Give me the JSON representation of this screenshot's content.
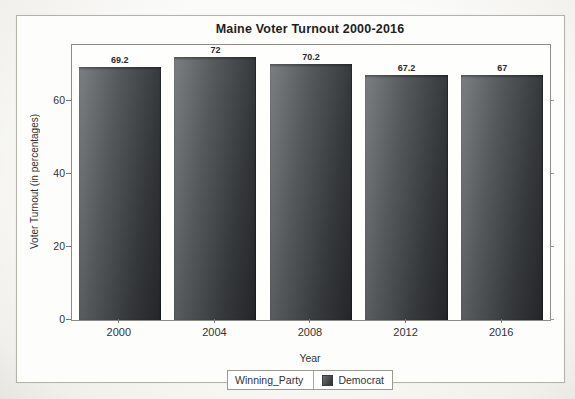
{
  "chart_data": {
    "type": "bar",
    "title": "Maine Voter Turnout 2000-2016",
    "categories": [
      "2000",
      "2004",
      "2008",
      "2012",
      "2016"
    ],
    "values": [
      69.2,
      72,
      70.2,
      67.2,
      67
    ],
    "bar_labels": [
      "69.2",
      "72",
      "70.2",
      "67.2",
      "67"
    ],
    "xlabel": "Year",
    "ylabel": "Voter Turnout (in percentages)",
    "ylim": [
      0,
      75.3
    ],
    "yticks": [
      0,
      20,
      40,
      60
    ],
    "grid": false,
    "bar_color_top": "#7b7f81",
    "bar_color_bottom": "#232527",
    "legend": {
      "position": "bottom-center",
      "label": "Winning_Party",
      "entries": [
        {
          "name": "Democrat",
          "color": "#3a3d3f"
        }
      ]
    }
  }
}
